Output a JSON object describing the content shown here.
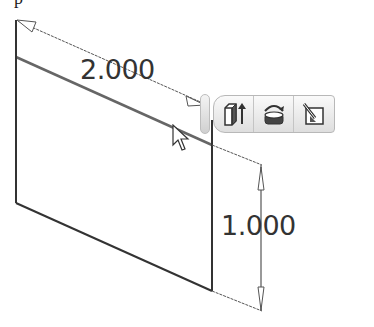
{
  "header": {
    "cut_text": "p"
  },
  "sketch": {
    "dimensions": {
      "width": "2.000",
      "height": "1.000"
    }
  },
  "minitoolbar": {
    "buttons": [
      {
        "name": "extrude",
        "icon": "extrude-icon"
      },
      {
        "name": "revolve",
        "icon": "revolve-icon"
      },
      {
        "name": "edit-sketch",
        "icon": "edit-sketch-icon"
      }
    ]
  },
  "colors": {
    "line": "#333333",
    "dim_line": "#555555",
    "toolbar_border": "#b8b8b8"
  }
}
